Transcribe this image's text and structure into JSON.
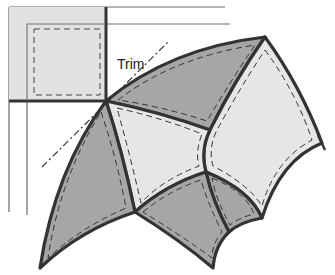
{
  "diagram": {
    "type": "quilt-trim-illustration",
    "annotations": [
      {
        "id": "trim",
        "text": "Trim"
      }
    ],
    "colors": {
      "dark_patch": "#a6a6a6",
      "light_patch": "#e6e6e6",
      "square": "#e2e2e2",
      "seam": "#333333",
      "guide": "#555555"
    }
  }
}
